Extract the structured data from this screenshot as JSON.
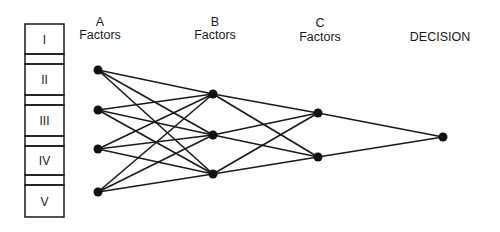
{
  "diagram": {
    "levels": [
      {
        "id": "I"
      },
      {
        "id": "II"
      },
      {
        "id": "III"
      },
      {
        "id": "IV"
      },
      {
        "id": "V"
      }
    ],
    "columns": {
      "a": {
        "letter": "A",
        "word": "Factors"
      },
      "b": {
        "letter": "B",
        "word": "Factors"
      },
      "c": {
        "letter": "C",
        "word": "Factors"
      },
      "decision": {
        "word": "DECISION"
      }
    },
    "nodes": {
      "a": [
        [
          98,
          70
        ],
        [
          98,
          110
        ],
        [
          98,
          149
        ],
        [
          98,
          192
        ]
      ],
      "b": [
        [
          213,
          94
        ],
        [
          213,
          135
        ],
        [
          213,
          174
        ]
      ],
      "c": [
        [
          318,
          113
        ],
        [
          318,
          157
        ]
      ],
      "decision": [
        [
          443,
          137
        ]
      ]
    },
    "edges": "fully connected between adjacent layers A→B→C→DECISION",
    "colors": {
      "line": "#1a1a1a",
      "node": "#111111"
    }
  }
}
